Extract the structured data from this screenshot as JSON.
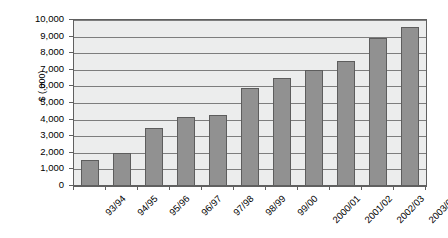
{
  "chart_data": {
    "type": "bar",
    "title": "",
    "subtitle": "",
    "xlabel": "",
    "ylabel": "$ (,000)",
    "categories": [
      "93/94",
      "94/95",
      "95/96",
      "96/97",
      "97/98",
      "98/99",
      "99/00",
      "2000/01",
      "2001/02",
      "2002/03",
      "2003/04"
    ],
    "values": [
      1550,
      2000,
      3500,
      4150,
      4250,
      5900,
      6500,
      7000,
      7500,
      8900,
      9600
    ],
    "ylim": [
      0,
      10000
    ],
    "ytick_labels": [
      "10,000",
      "9,000",
      "8,000",
      "7,000",
      "6,000",
      "5,000",
      "4,000",
      "3,000",
      "2,000",
      "1,000",
      "0"
    ],
    "ytick_values": [
      10000,
      9000,
      8000,
      7000,
      6000,
      5000,
      4000,
      3000,
      2000,
      1000,
      0
    ],
    "ytick_step": 1000,
    "grid": true,
    "legend": false,
    "legend_position": "none",
    "series": [
      {
        "name": "",
        "values": [
          1550,
          2000,
          3500,
          4150,
          4250,
          5900,
          6500,
          7000,
          7500,
          8900,
          9600
        ]
      }
    ],
    "colors": {
      "bar_fill": "#919191",
      "bar_border": "#5d5d5d",
      "plot_background": "#eceded",
      "gridline": "#7d7d7d",
      "axis": "#606060",
      "text": "#000000",
      "page_background": "#ffffff"
    },
    "x_label_rotation": -45
  }
}
